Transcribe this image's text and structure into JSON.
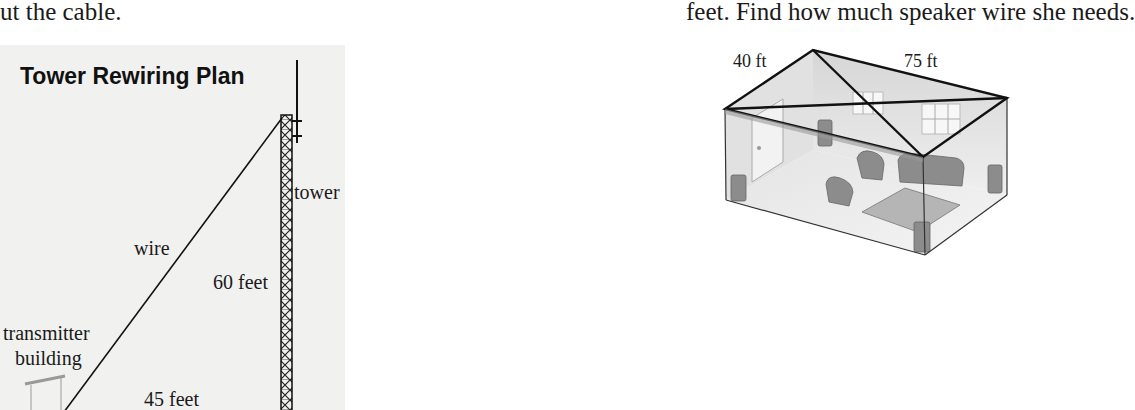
{
  "text": {
    "left_fragment": "ut the cable.",
    "right_fragment": "feet. Find how much speaker wire she needs."
  },
  "tower_figure": {
    "title": "Tower Rewiring Plan",
    "labels": {
      "tower": "tower",
      "wire": "wire",
      "height": "60 feet",
      "building_line1": "transmitter",
      "building_line2": "building",
      "distance": "45 feet"
    },
    "colors": {
      "background": "#f1f1f0",
      "line": "#1a1a1a"
    }
  },
  "room_figure": {
    "labels": {
      "width": "40 ft",
      "length": "75 ft"
    },
    "colors": {
      "wall": "#d8d8d8",
      "line": "#1a1a1a",
      "furniture": "#8a8a8a"
    }
  }
}
